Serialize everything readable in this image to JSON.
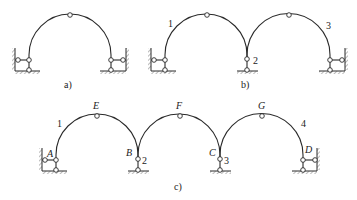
{
  "figure": {
    "subfigures": [
      {
        "id": "a",
        "caption": "a)",
        "description": "Three-hinged arch with two double-link supports",
        "labels": []
      },
      {
        "id": "b",
        "caption": "b)",
        "description": "Two connected arches on three supports",
        "labels": [
          "1",
          "2",
          "3"
        ]
      },
      {
        "id": "c",
        "caption": "c)",
        "description": "Three connected arches on four supports",
        "labels": [
          "1",
          "2",
          "3",
          "4"
        ],
        "point_labels": [
          "A",
          "B",
          "C",
          "D",
          "E",
          "F",
          "G"
        ]
      }
    ]
  }
}
